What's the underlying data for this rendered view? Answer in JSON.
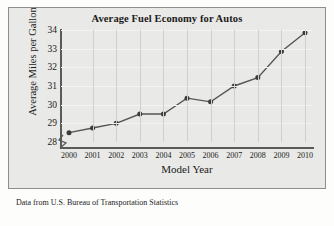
{
  "chart_data": {
    "type": "line",
    "title": "Average Fuel Economy for Autos",
    "xlabel": "Model Year",
    "ylabel": "Average Miles per Gallon",
    "categories": [
      "2000",
      "2001",
      "2002",
      "2003",
      "2004",
      "2005",
      "2006",
      "2007",
      "2008",
      "2009",
      "2010"
    ],
    "x": [
      2000,
      2001,
      2002,
      2003,
      2004,
      2005,
      2006,
      2007,
      2008,
      2009,
      2010
    ],
    "values": [
      28.5,
      28.75,
      29.0,
      29.5,
      29.5,
      30.35,
      30.15,
      31.0,
      31.45,
      32.85,
      33.85
    ],
    "series": [
      {
        "name": "Average Miles per Gallon",
        "values": [
          28.5,
          28.75,
          29.0,
          29.5,
          29.5,
          30.35,
          30.15,
          31.0,
          31.45,
          32.85,
          33.85
        ]
      }
    ],
    "yticks": [
      28,
      29,
      30,
      31,
      32,
      33,
      34
    ],
    "ylim": [
      28,
      34
    ],
    "xlim": [
      2000,
      2010
    ],
    "grid": true,
    "legend": false,
    "legend_position": "none",
    "y_axis_broken": true,
    "marker": "filled-circle",
    "line_color": "#555553",
    "marker_color": "#3b3b39",
    "panel_background": "#e9e9e7",
    "gridline_color": "#cfcfcc"
  },
  "footnote": {
    "text": "Data from U.S. Bureau of Transportation Statistics"
  },
  "axis_break_icon": "axis-break-zigzag"
}
